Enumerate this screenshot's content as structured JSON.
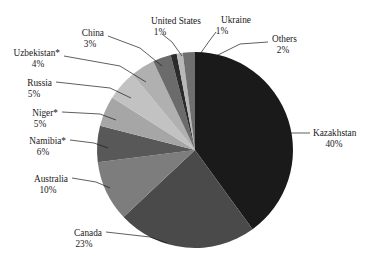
{
  "chart_data": {
    "type": "pie",
    "title": "",
    "subtitle": "",
    "xlabel": "",
    "ylabel": "",
    "legend_position": "none",
    "grid": false,
    "label_format": "name + percent",
    "start_angle_deg": 0,
    "direction": "clockwise",
    "total_percent": 100,
    "categories": [
      "Kazakhstan",
      "Canada",
      "Australia",
      "Namibia*",
      "Niger*",
      "Russia",
      "Uzbekistan*",
      "China",
      "United States",
      "Ukraine",
      "Others"
    ],
    "values": [
      40,
      23,
      10,
      6,
      5,
      5,
      4,
      3,
      1,
      1,
      2
    ],
    "slices": [
      {
        "name": "Kazakhstan",
        "value": 40,
        "percent_label": "40%",
        "color": "#1a1a1a"
      },
      {
        "name": "Canada",
        "value": 23,
        "percent_label": "23%",
        "color": "#4a4a4a"
      },
      {
        "name": "Australia",
        "value": 10,
        "percent_label": "10%",
        "color": "#7d7d7d"
      },
      {
        "name": "Namibia*",
        "value": 6,
        "percent_label": "6%",
        "color": "#585858"
      },
      {
        "name": "Niger*",
        "value": 5,
        "percent_label": "5%",
        "color": "#a6a6a6"
      },
      {
        "name": "Russia",
        "value": 5,
        "percent_label": "5%",
        "color": "#c2c2c2"
      },
      {
        "name": "Uzbekistan*",
        "value": 4,
        "percent_label": "4%",
        "color": "#b0b0b0"
      },
      {
        "name": "China",
        "value": 3,
        "percent_label": "3%",
        "color": "#6b6b6b"
      },
      {
        "name": "United States",
        "value": 1,
        "percent_label": "1%",
        "color": "#2b2b2b"
      },
      {
        "name": "Ukraine",
        "value": 1,
        "percent_label": "1%",
        "color": "#b8b8b8"
      },
      {
        "name": "Others",
        "value": 2,
        "percent_label": "2%",
        "color": "#6f6f6f"
      }
    ]
  },
  "labels": {
    "kazakhstan": {
      "name": "Kazakhstan",
      "pct": "40%"
    },
    "canada": {
      "name": "Canada",
      "pct": "23%"
    },
    "australia": {
      "name": "Australia",
      "pct": "10%"
    },
    "namibia": {
      "name": "Namibia*",
      "pct": "6%"
    },
    "niger": {
      "name": "Niger*",
      "pct": "5%"
    },
    "russia": {
      "name": "Russia",
      "pct": "5%"
    },
    "uzbekistan": {
      "name": "Uzbekistan*",
      "pct": "4%"
    },
    "china": {
      "name": "China",
      "pct": "3%"
    },
    "united_states": {
      "name": "United States",
      "pct": "1%"
    },
    "ukraine": {
      "name": "Ukraine",
      "pct": "1%"
    },
    "others": {
      "name": "Others",
      "pct": "2%"
    }
  },
  "colors": {
    "background": "#ffffff",
    "text": "#1a1a1a",
    "leader_line": "#1a1a1a"
  }
}
